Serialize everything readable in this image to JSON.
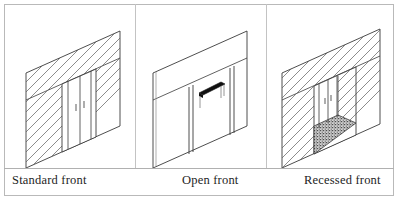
{
  "figure": {
    "cells": [
      {
        "id": "standard",
        "caption": "Standard front",
        "description": "Isometric line drawing of a flat storefront wall with hatched masonry at both sides and a pair of centered doors flush with the facade.",
        "elements": [
          "hatched-wall-left",
          "hatched-wall-right",
          "door-leaf-left",
          "door-leaf-right",
          "door-handle-left",
          "door-handle-right",
          "header-band"
        ]
      },
      {
        "id": "open",
        "caption": "Open front",
        "description": "Isometric line drawing of a storefront with no infill wall, only slender vertical mullions, and a dark display table standing inside the opening.",
        "elements": [
          "blank-wall-left",
          "mullion-left",
          "mullion-right",
          "display-table",
          "header-band"
        ]
      },
      {
        "id": "recessed",
        "caption": "Recessed front",
        "description": "Isometric line drawing of a storefront whose centre bay steps back, creating a stippled recessed entry floor flanked by hatched returns and a pair of doors set deep in the reveal.",
        "elements": [
          "hatched-wall-left",
          "hatched-wall-right",
          "hatched-return-wall",
          "recessed-floor",
          "door-leaf-left",
          "door-leaf-right",
          "door-handle-left",
          "door-handle-right",
          "header-band"
        ]
      }
    ]
  },
  "colors": {
    "line": "#3a3a3a",
    "hatch": "#5a5a5a",
    "frame": "#b9b9b9",
    "caption_rule": "#b0b0b0",
    "fill": "#ffffff",
    "dark_object": "#101010",
    "recessed_floor": "#4a4a4a",
    "text": "#1d1d1d"
  }
}
